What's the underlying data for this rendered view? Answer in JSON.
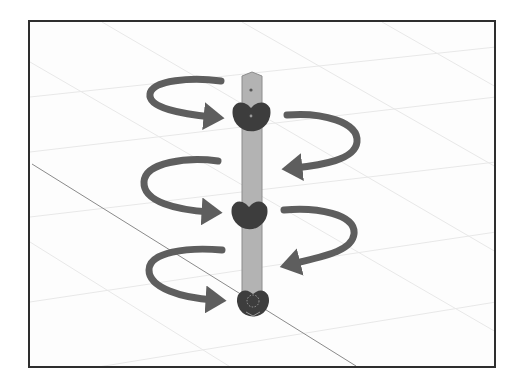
{
  "diagram": {
    "colors": {
      "background": "#fdfdfd",
      "frame": "#2e2e2e",
      "grid_line": "#e6e6e6",
      "axis_line": "#8a8a8a",
      "bone": "#b3b3b3",
      "bone_outline": "#8c8c8c",
      "joint": "#3d3d3d",
      "arrow": "#5e5e5e"
    },
    "bone": {
      "x": 240,
      "width": 20,
      "top": 70,
      "bottom": 296
    },
    "joints": [
      {
        "name": "top-joint",
        "cx": 249,
        "cy": 114,
        "r": 19
      },
      {
        "name": "middle-joint",
        "cx": 247,
        "cy": 213,
        "r": 18
      },
      {
        "name": "root-joint",
        "cx": 251,
        "cy": 300,
        "r": 16
      }
    ],
    "arrows": [
      {
        "name": "rotation-arrow-left-top",
        "direction": "clockwise-into-joint"
      },
      {
        "name": "rotation-arrow-right-top",
        "direction": "counterclockwise-into-bone"
      },
      {
        "name": "rotation-arrow-left-middle",
        "direction": "clockwise-into-joint"
      },
      {
        "name": "rotation-arrow-right-middle",
        "direction": "counterclockwise-into-bone"
      },
      {
        "name": "rotation-arrow-left-bottom",
        "direction": "clockwise-into-joint"
      }
    ]
  }
}
